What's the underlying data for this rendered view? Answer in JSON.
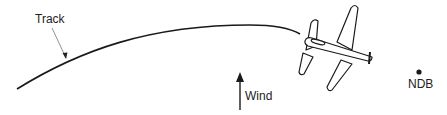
{
  "labels": {
    "track": "Track",
    "wind": "Wind",
    "ndb": "NDB"
  },
  "colors": {
    "stroke": "#1a1a1a",
    "background": "#ffffff"
  }
}
